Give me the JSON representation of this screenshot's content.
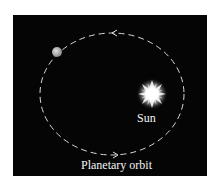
{
  "diagram": {
    "background_color": "#050505",
    "orbit": {
      "shape": "ellipse",
      "style": "dashed",
      "color": "#d8d8d8",
      "direction": "counter-clockwise",
      "label": "Planetary orbit"
    },
    "sun": {
      "label": "Sun",
      "color": "#ffffff"
    },
    "planet": {
      "color": "#a8a8a8"
    },
    "arrows": [
      {
        "position": "top",
        "points": "left"
      },
      {
        "position": "bottom",
        "points": "right"
      }
    ]
  }
}
